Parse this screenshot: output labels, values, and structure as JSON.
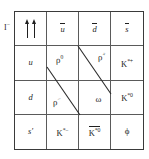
{
  "figure": {
    "type": "meson-nonet-grid",
    "row_label": {
      "base": "I",
      "sup": "−"
    },
    "grid": {
      "columns": 4,
      "rows": 4,
      "cells": [
        [
          {
            "name": "spin-arrows",
            "kind": "arrows",
            "text": "↑↑"
          },
          {
            "name": "u-antiquark",
            "kind": "overbar",
            "base": "u",
            "sup": "",
            "text": "ū"
          },
          {
            "name": "d-antiquark",
            "kind": "overbar",
            "base": "d",
            "sup": "",
            "text": "d̄"
          },
          {
            "name": "s-antiquark",
            "kind": "overbar",
            "base": "s",
            "sup": "",
            "text": "s̄"
          }
        ],
        [
          {
            "name": "u-quark",
            "kind": "plain",
            "base": "u",
            "sup": "",
            "text": "u"
          },
          {
            "name": "rho-zero",
            "kind": "sup",
            "base": "ρ",
            "sup": "0",
            "text": "ρ⁰"
          },
          {
            "name": "rho-plus",
            "kind": "sup",
            "base": "ρ",
            "sup": "+",
            "text": "ρ⁺"
          },
          {
            "name": "k-star-plus",
            "kind": "sup",
            "base": "K",
            "sup": "*+",
            "text": "K*⁺"
          }
        ],
        [
          {
            "name": "d-quark",
            "kind": "plain",
            "base": "d",
            "sup": "",
            "text": "d"
          },
          {
            "name": "rho-minus",
            "kind": "sup",
            "base": "ρ",
            "sup": "−",
            "text": "ρ⁻"
          },
          {
            "name": "omega",
            "kind": "plain",
            "base": "ω",
            "sup": "",
            "text": "ω"
          },
          {
            "name": "k-star-zero",
            "kind": "sup",
            "base": "K",
            "sup": "*0",
            "text": "K*⁰"
          }
        ],
        [
          {
            "name": "s-prime-quark",
            "kind": "plain",
            "base": "s′",
            "sup": "",
            "text": "s′"
          },
          {
            "name": "k-star-minus",
            "kind": "sup",
            "base": "K",
            "sup": "*−",
            "text": "K*⁻"
          },
          {
            "name": "k-star-zero-bar",
            "kind": "overbar-sup",
            "base": "K",
            "sup": "*0",
            "text": "K̄*⁰"
          },
          {
            "name": "phi",
            "kind": "plain",
            "base": "ϕ",
            "sup": "",
            "text": "ϕ"
          }
        ]
      ]
    },
    "diagonals": [
      {
        "name": "upper-band-line",
        "x1": 78,
        "y1": 46,
        "x2": 111,
        "y2": 94
      },
      {
        "name": "lower-band-line",
        "x1": 47,
        "y1": 67,
        "x2": 80,
        "y2": 115
      }
    ],
    "colors": {
      "ink": "#1f1f1f",
      "grid_line": "#5a5a5a",
      "outer_border": "#3a3a3a",
      "background": "#ffffff"
    }
  }
}
